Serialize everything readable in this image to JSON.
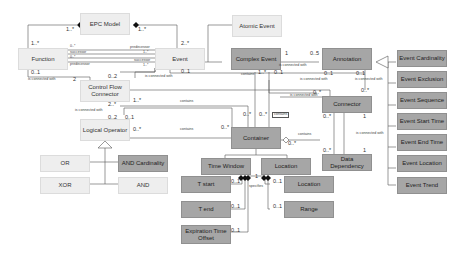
{
  "diagram": {
    "type": "uml-class-diagram",
    "classes": {
      "epc_model": "EPC Model",
      "function": "Function",
      "event": "Event",
      "atomic_event": "Atomic Event",
      "complex_event": "Complex Event",
      "annotation": "Annotation",
      "control_flow_connector": "Control Flow Connector",
      "logical_operator": "Logical Operator",
      "or": "OR",
      "xor": "XOR",
      "and_cardinality": "AND Cardinality",
      "and": "AND",
      "container": "Container",
      "connector": "Connector",
      "data_dependency": "Data Dependency",
      "time_window": "Time Window",
      "location": "Location",
      "t_start": "T start",
      "t_end": "T end",
      "expiration_time_offset": "Expiration Time Offset",
      "location_sub": "Location",
      "range": "Range",
      "event_cardinality": "Event Cardinality",
      "event_exclusion": "Event Exclusion",
      "event_sequence": "Event Sequence",
      "event_start_time": "Event Start Time",
      "event_end_time": "Event End Time",
      "event_location": "Event Location",
      "event_trend": "Event Trend"
    },
    "labels": {
      "m_epc_func": "1..*",
      "m_epc_event": "1..*",
      "m_func_top": "1..*",
      "m_event_top": "2..*",
      "m_f1": "0..*",
      "m_f2": "0..*",
      "m_e1": "1..*",
      "m_e2": "1..*",
      "successor": "successor",
      "predecessor": "predecessor",
      "m_func_01": "0..1",
      "m_func_2": "2",
      "is_connected_with": "is connected with",
      "m_cfc_02": "0..2",
      "m_event_01": "0..1",
      "m_ce_1": "1",
      "m_ann_05": "0..5",
      "m_ann_01a": "0..1",
      "m_ann_01b": "0..1",
      "m_conn_top": "0..*",
      "m_ce_1star": "1..*",
      "m_ce_01": "0..1",
      "contains": "contains",
      "m_cfc_2star": "2..*",
      "m_cfc_1star": "1..*",
      "m_lo_02": "0..2",
      "m_lo_01": "0..1",
      "m_lo_0star": "0..*",
      "m_cont_left": "0..*",
      "m_cont_t1": "0..*",
      "m_cont_t2": "0..*",
      "m_cont_br": "0..*",
      "m_conn_left": "0..*",
      "m_conn_bl": "0..*",
      "m_conn_1": "1",
      "m_dd_0star": "0..*",
      "m_dd_1": "1",
      "m_tw_01a": "0..1",
      "m_tw_01b": "0..1",
      "m_tw_01c": "0..1",
      "m_loc_01a": "0..1",
      "m_loc_01b": "0..1",
      "m_tw_1": "1",
      "specifies": "specifies"
    }
  }
}
